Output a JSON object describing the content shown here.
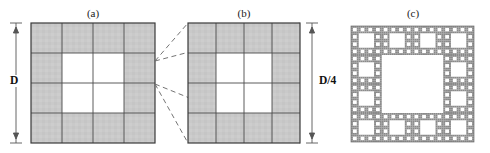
{
  "figure": {
    "caption_panels": [
      {
        "key": "a",
        "label": "(a)",
        "x": 93,
        "y": 8
      },
      {
        "key": "b",
        "label": "(b)",
        "x": 244,
        "y": 8
      },
      {
        "key": "c",
        "label": "(c)",
        "x": 413,
        "y": 8
      }
    ],
    "dimensions": [
      {
        "name": "overall-size",
        "label": "D",
        "x": 16,
        "y_top": 23,
        "y_bottom": 143,
        "label_x": 16,
        "label_y": 80
      },
      {
        "name": "cell-size",
        "label": "D/4",
        "x": 312,
        "y_top": 23,
        "y_bottom": 143,
        "label_x": 326,
        "label_y": 80
      }
    ],
    "colors": {
      "fill_gray": "#c9c9c9",
      "grid_line": "#4a4a4a",
      "outline": "#3a3a3a",
      "dashed": "#6a6a6a",
      "background": "#ffffff",
      "fractal_ink": "#7a7a7a",
      "text": "#111111"
    }
  },
  "chart_data": {
    "type": "diagram",
    "title": "",
    "panels": [
      {
        "key": "a",
        "label": "(a)",
        "kind": "grid-generator",
        "grid": 4,
        "bounds": {
          "x": 31,
          "y": 23,
          "w": 124,
          "h": 120
        },
        "filled_cells": [
          [
            0,
            0
          ],
          [
            1,
            0
          ],
          [
            2,
            0
          ],
          [
            3,
            0
          ],
          [
            0,
            1
          ],
          [
            3,
            1
          ],
          [
            0,
            2
          ],
          [
            3,
            2
          ],
          [
            0,
            3
          ],
          [
            1,
            3
          ],
          [
            2,
            3
          ],
          [
            3,
            3
          ]
        ],
        "empty_cells": [
          [
            1,
            1
          ],
          [
            2,
            1
          ],
          [
            1,
            2
          ],
          [
            2,
            2
          ]
        ],
        "dimension_label": "D",
        "filled_count": 12,
        "total_cells": 16
      },
      {
        "key": "b",
        "label": "(b)",
        "kind": "grid-generator",
        "grid": 4,
        "bounds": {
          "x": 188,
          "y": 23,
          "w": 112,
          "h": 120
        },
        "filled_cells": [
          [
            0,
            0
          ],
          [
            1,
            0
          ],
          [
            2,
            0
          ],
          [
            3,
            0
          ],
          [
            0,
            1
          ],
          [
            3,
            1
          ],
          [
            0,
            2
          ],
          [
            3,
            2
          ],
          [
            0,
            3
          ],
          [
            1,
            3
          ],
          [
            2,
            3
          ],
          [
            3,
            3
          ]
        ],
        "empty_cells": [
          [
            1,
            1
          ],
          [
            2,
            1
          ],
          [
            1,
            2
          ],
          [
            2,
            2
          ]
        ],
        "dimension_label": "D/4",
        "filled_count": 12,
        "total_cells": 16
      },
      {
        "key": "c",
        "label": "(c)",
        "kind": "fractal",
        "iterations": 3,
        "grid": 4,
        "bounds": {
          "x": 351,
          "y": 26,
          "w": 123,
          "h": 116
        }
      }
    ],
    "connector_lines": [
      {
        "from": [
          155,
          61
        ],
        "to": [
          188,
          23
        ]
      },
      {
        "from": [
          155,
          61
        ],
        "to": [
          300,
          23
        ]
      },
      {
        "from": [
          155,
          84
        ],
        "to": [
          188,
          143
        ]
      },
      {
        "from": [
          155,
          84
        ],
        "to": [
          300,
          143
        ]
      }
    ],
    "xlabel": "",
    "ylabel": ""
  }
}
